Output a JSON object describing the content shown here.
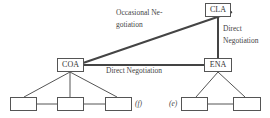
{
  "diagram": {
    "nodes": {
      "cla": {
        "label": "CLA"
      },
      "coa": {
        "label": "COA"
      },
      "ena": {
        "label": "ENA"
      }
    },
    "edges": {
      "coa_cla": {
        "label_line1": "Occasional Ne-",
        "label_line2": "gotiation"
      },
      "coa_ena": {
        "label": "Direct Negotiation"
      },
      "cla_ena": {
        "label_line1": "Direct",
        "label_line2": "Negotiation"
      }
    },
    "subgroups": {
      "left": {
        "marker": "(f)",
        "child_count": 3
      },
      "right": {
        "marker": "(e)",
        "child_count": 2
      }
    },
    "colors": {
      "line": "#555555",
      "thick_line": "#444444",
      "text": "#333333"
    }
  }
}
